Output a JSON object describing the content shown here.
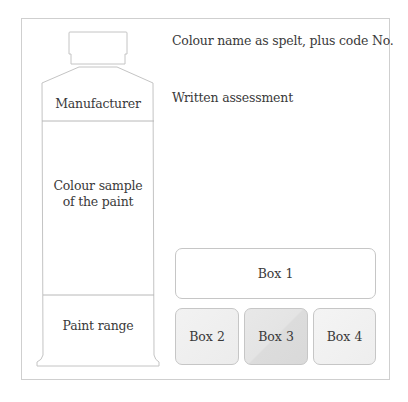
{
  "tube": {
    "manufacturer_label": "Manufacturer",
    "colour_sample_line1": "Colour sample",
    "colour_sample_line2": "of the paint",
    "paint_range_label": "Paint range"
  },
  "fields": {
    "colour_name": "Colour name as spelt, plus code No.",
    "written_assessment": "Written assessment"
  },
  "boxes": [
    {
      "label": "Box 1"
    },
    {
      "label": "Box 2"
    },
    {
      "label": "Box 3"
    },
    {
      "label": "Box 4"
    }
  ],
  "colors": {
    "line": "#c8c8c8",
    "text": "#3a3a3a",
    "box3_fill": "#dedede",
    "box_light_fill": "#f0f0f0"
  }
}
